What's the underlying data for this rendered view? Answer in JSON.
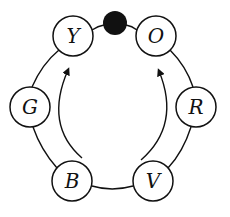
{
  "diagram": {
    "colors": {
      "stroke": "#111111",
      "fill": "#ffffff",
      "dot": "#111111"
    },
    "ring_edges": [
      {
        "from": "Y",
        "to": "dot"
      },
      {
        "from": "dot",
        "to": "O"
      },
      {
        "from": "O",
        "to": "R"
      },
      {
        "from": "R",
        "to": "V"
      },
      {
        "from": "V",
        "to": "B"
      },
      {
        "from": "B",
        "to": "G"
      },
      {
        "from": "G",
        "to": "Y"
      }
    ],
    "nodes": [
      {
        "id": "Y",
        "label": "Y",
        "cx": 73,
        "cy": 36,
        "r": 20
      },
      {
        "id": "O",
        "label": "O",
        "cx": 156,
        "cy": 36,
        "r": 20
      },
      {
        "id": "R",
        "label": "R",
        "cx": 196,
        "cy": 107,
        "r": 20
      },
      {
        "id": "V",
        "label": "V",
        "cx": 153,
        "cy": 181,
        "r": 20
      },
      {
        "id": "B",
        "label": "B",
        "cx": 72,
        "cy": 181,
        "r": 20
      },
      {
        "id": "G",
        "label": "G",
        "cx": 30,
        "cy": 107,
        "r": 20
      }
    ],
    "marker": {
      "id": "dot",
      "cx": 115,
      "cy": 23,
      "r": 12,
      "style": "filled-black"
    },
    "arrows": [
      {
        "from": "B",
        "to": "Y",
        "direction": "counter-clockwise-up-left"
      },
      {
        "from": "V",
        "to": "O",
        "direction": "clockwise-up-right"
      }
    ]
  }
}
